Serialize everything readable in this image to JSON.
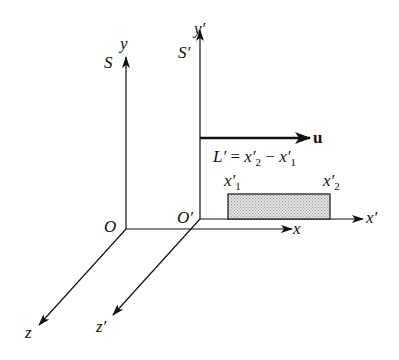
{
  "frame_S": {
    "name": "S",
    "origin": "O",
    "x": "x",
    "y": "y",
    "z": "z"
  },
  "frame_S_prime": {
    "name": "S′",
    "origin": "O′",
    "x": "x′",
    "y": "y′",
    "z": "z′"
  },
  "velocity": {
    "label": "u"
  },
  "length_equation": {
    "L": "L′",
    "eq": " = ",
    "x2": "x′",
    "x2sub": "2",
    "minus": " − ",
    "x1": "x′",
    "x1sub": "1"
  },
  "rod_ends": {
    "left": "x′",
    "left_sub": "1",
    "right": "x′",
    "right_sub": "2"
  },
  "colors": {
    "line": "#111111",
    "rod_fill": "#d0d0d0"
  }
}
